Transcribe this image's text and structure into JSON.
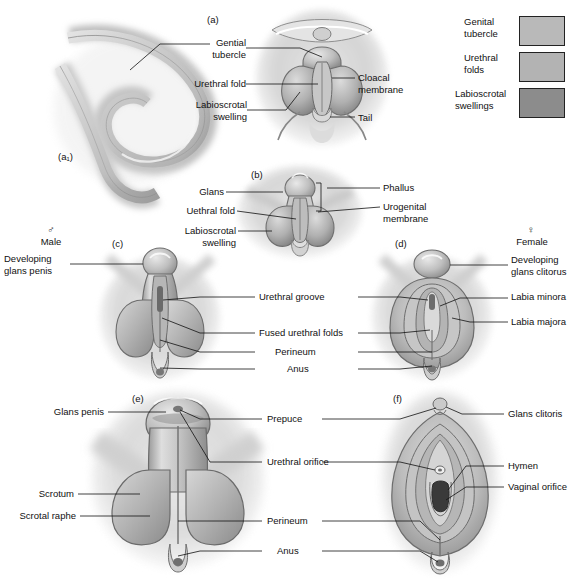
{
  "figure": {
    "background": "#ffffff",
    "line_color": "#111111",
    "tissue_light": "#cfcfcf",
    "tissue_mid": "#a8a8a8",
    "tissue_dark": "#7d7d7d"
  },
  "legend": {
    "items": [
      {
        "label": "Genital\ntubercle",
        "color": "#b9b9b9",
        "name": "genital-tubercle"
      },
      {
        "label": "Urethral\nfolds",
        "color": "#b3b3b3",
        "name": "urethral-folds"
      },
      {
        "label": "Labioscrotal\nswellings",
        "color": "#8c8c8c",
        "name": "labioscrotal-swellings"
      }
    ]
  },
  "panels": {
    "a": {
      "id": "(a)",
      "caption": "Indifferent stage perineal view"
    },
    "a1": {
      "id": "(a₁)",
      "caption": "Indifferent stage sagittal view"
    },
    "b": {
      "id": "(b)",
      "caption": "Indifferent stage, later"
    },
    "c": {
      "id": "(c)",
      "caption": "Male differentiation"
    },
    "d": {
      "id": "(d)",
      "caption": "Female differentiation"
    },
    "e": {
      "id": "(e)",
      "caption": "Male at birth"
    },
    "f": {
      "id": "(f)",
      "caption": "Female at birth"
    }
  },
  "sex_headers": {
    "male": {
      "symbol": "♂",
      "label": "Male"
    },
    "female": {
      "symbol": "♀",
      "label": "Female"
    }
  },
  "labels": {
    "a_genital_tubercle": "Gential\ntubercle",
    "a_urethral_fold": "Urethral fold",
    "a_labioscrotal_swelling": "Labioscrotal\nswelling",
    "a_cloacal_membrane": "Cloacal\nmembrane",
    "a_tail": "Tail",
    "b_glans": "Glans",
    "b_urethral_fold": "Uethral fold",
    "b_labioscrotal_swelling": "Labioscrotal\nswelling",
    "b_phallus": "Phallus",
    "b_urogenital_membrane": "Urogenital\nmembrane",
    "c_developing_glans_penis": "Developing\nglans penis",
    "d_developing_glans_clitoris": "Developing\nglans clitorus",
    "cd_urethral_groove": "Urethral groove",
    "cd_fused_urethral_folds": "Fused urethral folds",
    "cd_perineum": "Perineum",
    "cd_anus": "Anus",
    "d_labia_minora": "Labia minora",
    "d_labia_majora": "Labia majora",
    "e_glans_penis": "Glans penis",
    "e_scrotum": "Scrotum",
    "e_scrotal_raphe": "Scrotal raphe",
    "ef_prepuce": "Prepuce",
    "ef_urethral_orifice": "Urethral orifice",
    "ef_perineum": "Perineum",
    "ef_anus": "Anus",
    "f_glans_clitoris": "Glans clitoris",
    "f_hymen": "Hymen",
    "f_vaginal_orifice": "Vaginal orifice"
  }
}
